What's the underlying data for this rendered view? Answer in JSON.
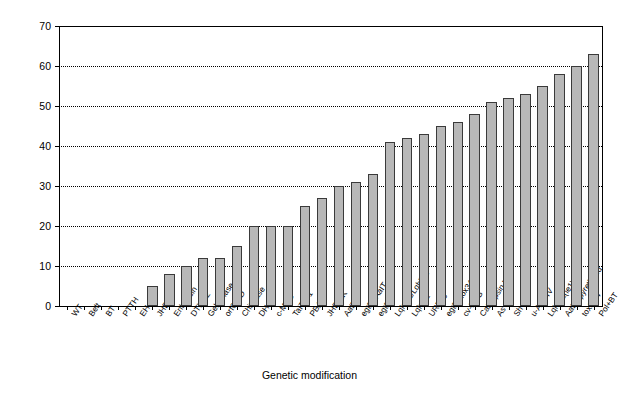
{
  "chart_data": {
    "type": "bar",
    "title": "",
    "xlabel": "Genetic modification",
    "ylabel": "Improvement over wild type (%)",
    "ylim": [
      0,
      70
    ],
    "ytick_values": [
      0,
      10,
      20,
      30,
      40,
      50,
      60,
      70
    ],
    "ytick_labels": [
      "0",
      "10",
      "20",
      "30",
      "40",
      "50",
      "60",
      "70"
    ],
    "grid": "horizontal-dotted",
    "legend": "none",
    "bar_color": "#b8b8b8",
    "bar_edge_color": "#3a3a3a",
    "categories": [
      "WT",
      "Belt",
      "BT",
      "PTTH",
      "EH",
      "JHE",
      "Enhancin",
      "DTX9.2",
      "Gelatinase",
      "orf603D",
      "Chitinase",
      "DH",
      "c-MYC",
      "TaITX-1",
      "PBAN",
      "JHE-KK",
      "AaIT",
      "egtD+AaIT",
      "egtD",
      "LqhIT1/LqhIT2",
      "LqhIT2",
      "URF13",
      "egtD+tox34",
      "cv-PDG",
      "Cathepsin L",
      "As II",
      "Sh I",
      "u-Aga-IV",
      "LqhIT2(ie1)",
      "AaIT+pyrethroid",
      "tox34.4",
      "Pol+BT"
    ],
    "values": [
      0,
      0,
      0,
      0,
      0,
      5,
      8,
      10,
      12,
      12,
      15,
      20,
      20,
      20,
      25,
      27,
      30,
      31,
      33,
      41,
      42,
      43,
      45,
      46,
      48,
      51,
      52,
      53,
      55,
      58,
      60,
      63
    ]
  }
}
